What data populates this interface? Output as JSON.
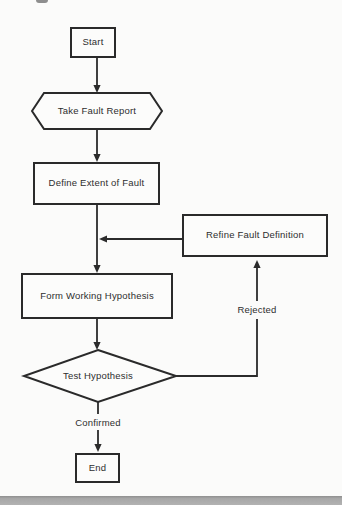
{
  "flowchart": {
    "nodes": [
      {
        "id": "start",
        "shape": "rectangle",
        "label": "Start"
      },
      {
        "id": "take-fault-report",
        "shape": "hexagon",
        "label": "Take Fault Report"
      },
      {
        "id": "define-extent-of-fault",
        "shape": "rectangle",
        "label": "Define Extent of Fault"
      },
      {
        "id": "refine-fault-definition",
        "shape": "rectangle",
        "label": "Refine Fault Definition"
      },
      {
        "id": "form-working-hypothesis",
        "shape": "rectangle",
        "label": "Form Working Hypothesis"
      },
      {
        "id": "test-hypothesis",
        "shape": "diamond",
        "label": "Test Hypothesis"
      },
      {
        "id": "end",
        "shape": "rectangle",
        "label": "End"
      }
    ],
    "edges": [
      {
        "from": "start",
        "to": "take-fault-report",
        "label": ""
      },
      {
        "from": "take-fault-report",
        "to": "define-extent-of-fault",
        "label": ""
      },
      {
        "from": "define-extent-of-fault",
        "to": "form-working-hypothesis",
        "label": ""
      },
      {
        "from": "form-working-hypothesis",
        "to": "test-hypothesis",
        "label": ""
      },
      {
        "from": "test-hypothesis",
        "to": "refine-fault-definition",
        "label": "Rejected"
      },
      {
        "from": "refine-fault-definition",
        "to": "form-working-hypothesis",
        "label": ""
      },
      {
        "from": "test-hypothesis",
        "to": "end",
        "label": "Confirmed"
      }
    ],
    "edge_labels": {
      "rejected": "Rejected",
      "confirmed": "Confirmed"
    },
    "colors": {
      "line": "#2b2b2b",
      "background": "#fbfbfa",
      "bottom_bar": "#a8a8a8"
    }
  }
}
